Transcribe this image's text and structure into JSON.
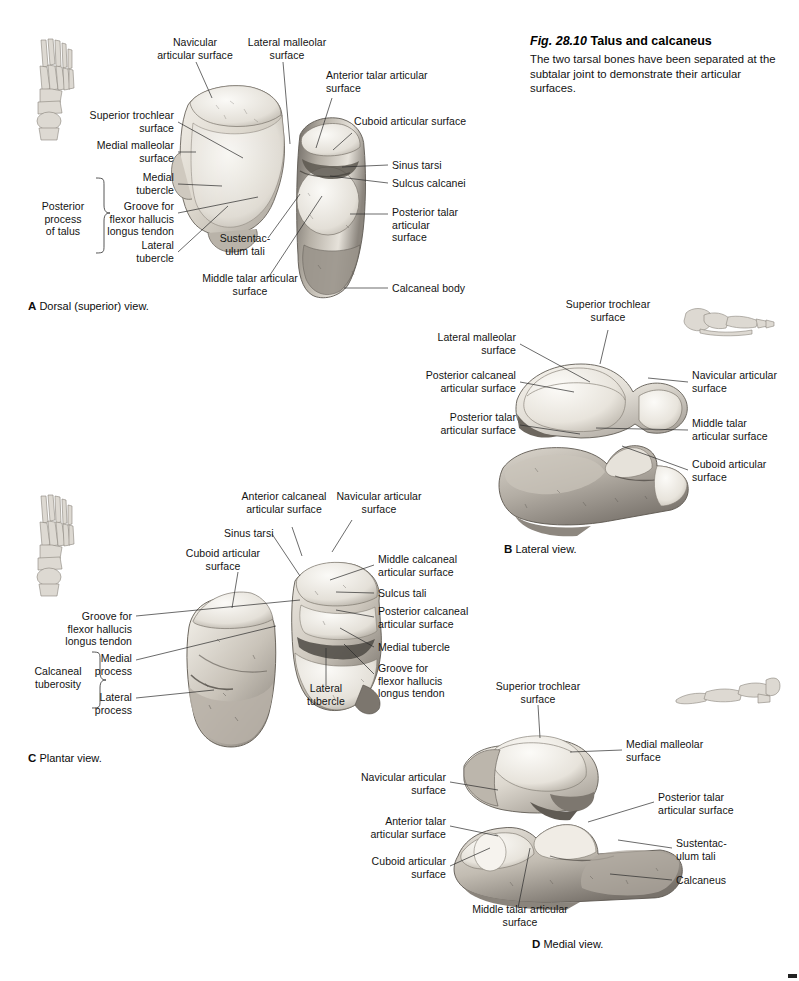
{
  "figure": {
    "number": "Fig. 28.10",
    "name": "Talus and calcaneus",
    "description": "The two tarsal bones have been separated at the subtalar joint to demonstrate their articular surfaces."
  },
  "panels": [
    {
      "id": "A",
      "letter": "A",
      "caption": "Dorsal (superior) view.",
      "orientation_icon": "foot-skeleton-dorsal-icon",
      "bracket_label": "Posterior\nprocess\nof talus",
      "labels": [
        {
          "text": "Navicular\narticular surface",
          "align": "center"
        },
        {
          "text": "Lateral malleolar\nsurface",
          "align": "center"
        },
        {
          "text": "Anterior talar articular\nsurface",
          "align": "left"
        },
        {
          "text": "Cuboid articular surface",
          "align": "left"
        },
        {
          "text": "Sinus tarsi",
          "align": "left"
        },
        {
          "text": "Sulcus calcanei",
          "align": "left"
        },
        {
          "text": "Posterior talar\narticular\nsurface",
          "align": "left"
        },
        {
          "text": "Calcaneal body",
          "align": "left"
        },
        {
          "text": "Superior trochlear\nsurface",
          "align": "right"
        },
        {
          "text": "Medial malleolar\nsurface",
          "align": "right"
        },
        {
          "text": "Medial\ntubercle",
          "align": "right"
        },
        {
          "text": "Groove for\nflexor hallucis\nlongus tendon",
          "align": "right"
        },
        {
          "text": "Lateral\ntubercle",
          "align": "right"
        },
        {
          "text": "Sustentac-\nulum tali",
          "align": "center"
        },
        {
          "text": "Middle talar articular\nsurface",
          "align": "center"
        }
      ]
    },
    {
      "id": "B",
      "letter": "B",
      "caption": "Lateral view.",
      "orientation_icon": "foot-skeleton-lateral-icon",
      "labels": [
        {
          "text": "Superior trochlear\nsurface",
          "align": "center"
        },
        {
          "text": "Lateral malleolar\nsurface",
          "align": "right"
        },
        {
          "text": "Posterior calcaneal\narticular surface",
          "align": "right"
        },
        {
          "text": "Posterior talar\narticular surface",
          "align": "right"
        },
        {
          "text": "Navicular articular\nsurface",
          "align": "left"
        },
        {
          "text": "Middle talar\narticular surface",
          "align": "left"
        },
        {
          "text": "Cuboid articular\nsurface",
          "align": "left"
        }
      ]
    },
    {
      "id": "C",
      "letter": "C",
      "caption": "Plantar view.",
      "orientation_icon": "foot-skeleton-plantar-icon",
      "bracket_label": "Calcaneal\ntuberosity",
      "labels": [
        {
          "text": "Anterior calcaneal\narticular surface",
          "align": "center"
        },
        {
          "text": "Navicular articular\nsurface",
          "align": "center"
        },
        {
          "text": "Sinus tarsi",
          "align": "left"
        },
        {
          "text": "Cuboid articular\nsurface",
          "align": "center"
        },
        {
          "text": "Middle calcaneal\narticular surface",
          "align": "left"
        },
        {
          "text": "Sulcus tali",
          "align": "left"
        },
        {
          "text": "Posterior calcaneal\narticular surface",
          "align": "left"
        },
        {
          "text": "Medial tubercle",
          "align": "left"
        },
        {
          "text": "Groove for\nflexor hallucis\nlongus tendon",
          "align": "left"
        },
        {
          "text": "Groove for\nflexor hallucis\nlongus tendon",
          "align": "right"
        },
        {
          "text": "Medial\nprocess",
          "align": "right"
        },
        {
          "text": "Lateral\nprocess",
          "align": "right"
        },
        {
          "text": "Lateral\ntubercle",
          "align": "center"
        }
      ]
    },
    {
      "id": "D",
      "letter": "D",
      "caption": "Medial view.",
      "orientation_icon": "foot-skeleton-medial-icon",
      "labels": [
        {
          "text": "Superior trochlear\nsurface",
          "align": "center"
        },
        {
          "text": "Medial malleolar\nsurface",
          "align": "left"
        },
        {
          "text": "Navicular articular\nsurface",
          "align": "right"
        },
        {
          "text": "Posterior talar\narticular surface",
          "align": "left"
        },
        {
          "text": "Anterior talar\narticular surface",
          "align": "right"
        },
        {
          "text": "Cuboid articular\nsurface",
          "align": "right"
        },
        {
          "text": "Sustentac-\nulum tali",
          "align": "left"
        },
        {
          "text": "Calcaneus",
          "align": "left"
        },
        {
          "text": "Middle talar articular\nsurface",
          "align": "center"
        }
      ]
    }
  ]
}
